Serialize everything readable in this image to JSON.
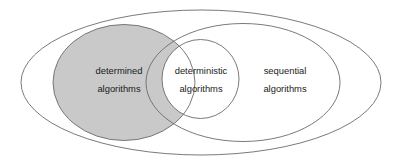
{
  "diagram": {
    "type": "euler-venn-diagram",
    "background_color": "#ffffff",
    "outline_color": "#6b6b6b",
    "text_color": "#1a1a1a",
    "highlight_fill": "#c9c9c9",
    "sets": [
      {
        "id": "sequential-algorithms",
        "label_line1": "sequential",
        "label_line2": "algorithms",
        "shape": "ellipse",
        "filled": false
      },
      {
        "id": "determined-algorithms",
        "label_line1": "determined",
        "label_line2": "algorithms",
        "shape": "ellipse",
        "filled": true,
        "fill_color": "#c9c9c9"
      },
      {
        "id": "deterministic-algorithms",
        "label_line1": "deterministic",
        "label_line2": "algorithms",
        "shape": "circle",
        "filled": false
      }
    ],
    "outer_set": {
      "id": "outer-universe",
      "shape": "ellipse",
      "filled": false,
      "label": ""
    },
    "labels": {
      "determined": {
        "line1": "determined",
        "line2": "algorithms",
        "x": 119,
        "y1": 74,
        "y2": 92
      },
      "deterministic": {
        "line1": "deterministic",
        "line2": "algorithms",
        "x": 201,
        "y1": 74,
        "y2": 92
      },
      "sequential": {
        "line1": "sequential",
        "line2": "algorithms",
        "x": 285,
        "y1": 74,
        "y2": 92
      }
    }
  }
}
